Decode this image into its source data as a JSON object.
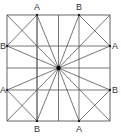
{
  "diagram": {
    "square": {
      "x1": 7,
      "y1": 15,
      "x2": 110,
      "y2": 121
    },
    "center": {
      "x": 58.5,
      "y": 68
    },
    "grid_x": [
      7,
      37,
      58.5,
      79,
      110
    ],
    "grid_y": [
      15,
      46,
      68,
      90,
      121
    ],
    "points": [
      {
        "label": "A",
        "x": 37,
        "y": 15,
        "lx": 34,
        "ly": 3
      },
      {
        "label": "B",
        "x": 79,
        "y": 15,
        "lx": 76,
        "ly": 3
      },
      {
        "label": "B",
        "x": 7,
        "y": 46,
        "lx": 0,
        "ly": 42
      },
      {
        "label": "A",
        "x": 110,
        "y": 46,
        "lx": 112,
        "ly": 42
      },
      {
        "label": "A",
        "x": 7,
        "y": 90,
        "lx": 0,
        "ly": 86
      },
      {
        "label": "B",
        "x": 110,
        "y": 90,
        "lx": 112,
        "ly": 86
      },
      {
        "label": "B",
        "x": 37,
        "y": 121,
        "lx": 34,
        "ly": 125
      },
      {
        "label": "A",
        "x": 79,
        "y": 121,
        "lx": 76,
        "ly": 125
      }
    ],
    "line_color": "#555555"
  }
}
